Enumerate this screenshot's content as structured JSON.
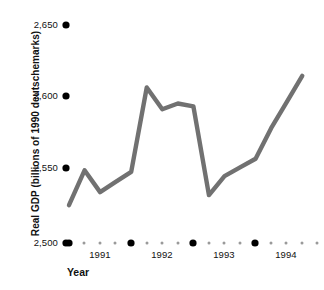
{
  "chart_data": {
    "type": "line",
    "title": "",
    "subtitle": "",
    "xlabel": "Year",
    "ylabel": "Real GDP (billions of 1990 deutschemarks)",
    "ylim": [
      2500,
      2650
    ],
    "ytick_labels": [
      "2,650",
      "2,600",
      "2,550",
      "2,500"
    ],
    "ytick_values": [
      2650,
      2600,
      2550,
      2500
    ],
    "xtick_labels": [
      "1991",
      "1992",
      "1993",
      "1994"
    ],
    "xtick_values": [
      1991,
      1992,
      1993,
      1994
    ],
    "grid": false,
    "legend": false,
    "legend_position": "none",
    "series": [
      {
        "name": "Real GDP",
        "color": "#717171",
        "x": [
          "1990 Q4",
          "1991 Q1",
          "1991 Q2",
          "1991 Q3",
          "1991 Q4",
          "1992 Q1",
          "1992 Q2",
          "1992 Q3",
          "1992 Q4",
          "1993 Q1",
          "1993 Q2",
          "1993 Q3",
          "1993 Q4",
          "1994 Q1",
          "1994 Q2",
          "1994 Q3"
        ],
        "values": [
          2526,
          2550,
          2535,
          2542,
          2549,
          2607,
          2592,
          2596,
          2594,
          2533,
          2546,
          2552,
          2558,
          2579,
          2597,
          2615
        ]
      }
    ],
    "annotations": []
  },
  "axes": {
    "y_title": "Real GDP (billions of 1990 deutschemarks)",
    "x_title": "Year",
    "y_labels": [
      {
        "text": "2,650"
      },
      {
        "text": "2,600"
      },
      {
        "text": "2,550"
      },
      {
        "text": "2,500"
      }
    ],
    "x_labels": [
      {
        "text": "1991"
      },
      {
        "text": "1992"
      },
      {
        "text": "1993"
      },
      {
        "text": "1994"
      }
    ]
  },
  "style": {
    "line_color": "#717171",
    "marker_color": "#000000",
    "text_color": "#111111",
    "background": "#ffffff",
    "dot_small_color": "#9a9a9a"
  }
}
